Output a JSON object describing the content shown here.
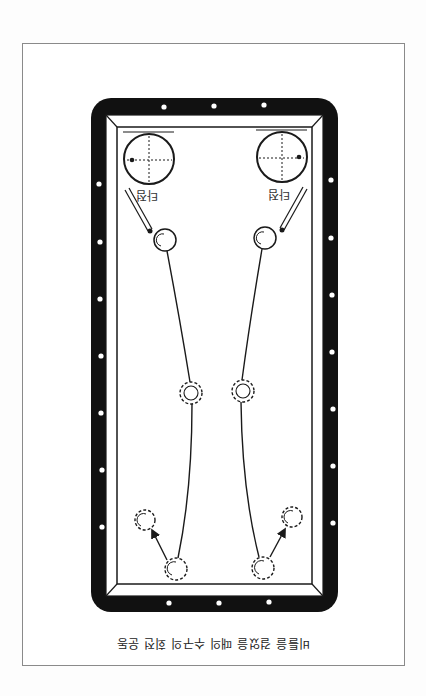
{
  "figure": {
    "orientation": "rotated-180",
    "caption": "비틀을 걸었을 때의 수구의 회전 운동",
    "colors": {
      "frame": "#111111",
      "rail": "#ffffff",
      "cloth": "#ffffff",
      "line": "#1a1a1a",
      "diamond": "#ffffff",
      "paper_border": "#8a8a8a"
    }
  },
  "table": {
    "diamonds_top": 3,
    "diamonds_bottom": 3,
    "diamonds_left": 7,
    "diamonds_right": 7
  },
  "left_shot": {
    "hit_point_label": "타점",
    "hit_point_side": "left",
    "path": [
      "cue-ball-start",
      "curve",
      "mid-ball",
      "curve",
      "cushion-ball",
      "arrow",
      "rebound-ball"
    ]
  },
  "right_shot": {
    "hit_point_label": "타점",
    "hit_point_side": "right",
    "path": [
      "cue-ball-start",
      "curve",
      "mid-ball",
      "curve",
      "cushion-ball",
      "arrow",
      "rebound-ball"
    ]
  }
}
